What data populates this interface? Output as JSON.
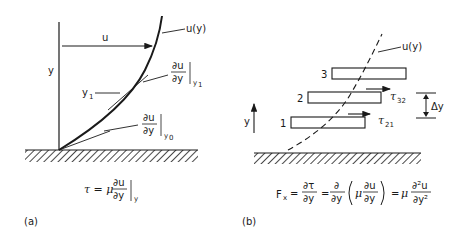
{
  "panel_a": {
    "caption": "(a)",
    "axis_label_y": "y",
    "velocity_label": "u",
    "profile_label": "u(y)",
    "y1_label": "y",
    "y1_sub": "1",
    "tangent_y1": {
      "num": "∂u",
      "den": "∂y",
      "eval": "y",
      "eval_sub": "1"
    },
    "tangent_y0": {
      "num": "∂u",
      "den": "∂y",
      "eval": "y",
      "eval_sub": "0"
    },
    "equation": {
      "lhs": "τ = μ",
      "num": "∂u",
      "den": "∂y",
      "eval": "y"
    }
  },
  "panel_b": {
    "caption": "(b)",
    "axis_label_y": "y",
    "profile_label": "u(y)",
    "layers": [
      {
        "label": "3"
      },
      {
        "label": "2"
      },
      {
        "label": "1"
      }
    ],
    "stress_32": {
      "sym": "τ",
      "sub": "32"
    },
    "stress_21": {
      "sym": "τ",
      "sub": "21"
    },
    "spacing_label": "Δy",
    "equation": {
      "lhs": "F",
      "lhs_sub": "x",
      "eq1": "=",
      "t1_num": "∂τ",
      "t1_den": "∂y",
      "eq2": "=",
      "t2_num": "∂",
      "t2_den": "∂y",
      "inner_mu": "μ",
      "inner_num": "∂u",
      "inner_den": "∂y",
      "eq3": "=",
      "t3_mu": "μ",
      "t3_num": "∂²u",
      "t3_den": "∂y²"
    }
  },
  "colors": {
    "ink": "#1a1a1a",
    "background": "#ffffff"
  }
}
